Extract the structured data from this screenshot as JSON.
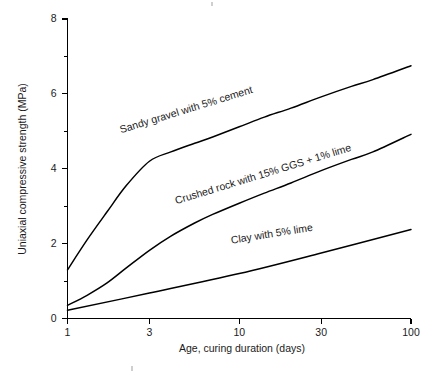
{
  "chart_data": {
    "type": "line",
    "title": "",
    "xlabel": "Age, curing duration (days)",
    "ylabel": "Uniaxial compressive strength (MPa)",
    "xscale": "log",
    "xlim": [
      1,
      100
    ],
    "ylim": [
      0,
      8
    ],
    "grid": false,
    "legend_position": "inline-labels",
    "xticks": [
      1,
      3,
      10,
      30,
      100
    ],
    "xtick_labels": [
      "1",
      "3",
      "10",
      "30",
      "100"
    ],
    "yticks": [
      0,
      2,
      4,
      6,
      8
    ],
    "ytick_labels": [
      "0",
      "2",
      "4",
      "6",
      "8"
    ],
    "yticks_minor": [
      1,
      3,
      5,
      7
    ],
    "series": [
      {
        "name": "Sandy gravel with 5% cement",
        "label": "Sandy gravel with 5% cement",
        "label_angle_deg": -17,
        "x": [
          1,
          1.3,
          1.7,
          2.2,
          3,
          4,
          5.5,
          7,
          10,
          14,
          20,
          30,
          45,
          60,
          100
        ],
        "values": [
          1.3,
          2.1,
          2.85,
          3.55,
          4.2,
          4.45,
          4.68,
          4.85,
          5.12,
          5.38,
          5.62,
          5.92,
          6.2,
          6.38,
          6.75
        ]
      },
      {
        "name": "Crushed rock with 15% GGS + 1% lime",
        "label": "Crushed rock with 15% GGS + 1% lime",
        "label_angle_deg": -17,
        "x": [
          1,
          1.3,
          1.7,
          2.2,
          3,
          4,
          5.5,
          7,
          10,
          14,
          20,
          30,
          45,
          60,
          100
        ],
        "values": [
          0.35,
          0.62,
          0.95,
          1.35,
          1.82,
          2.2,
          2.55,
          2.78,
          3.08,
          3.35,
          3.62,
          3.95,
          4.25,
          4.45,
          4.92
        ]
      },
      {
        "name": "Clay with 5% lime",
        "label": "Clay with 5% lime",
        "label_angle_deg": -9,
        "x": [
          1,
          3,
          10,
          30,
          100
        ],
        "values": [
          0.22,
          0.68,
          1.2,
          1.75,
          2.38
        ]
      }
    ],
    "series_label_anchors": [
      {
        "x": 2.05,
        "y": 4.95
      },
      {
        "x": 4.3,
        "y": 3.05
      },
      {
        "x": 9.0,
        "y": 2.0
      }
    ]
  },
  "axis": {
    "x_title": "Age, curing duration (days)",
    "y_title": "Uniaxial compressive strength (MPa)"
  }
}
